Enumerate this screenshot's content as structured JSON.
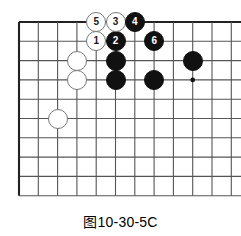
{
  "figure": {
    "caption": "图10-30-5C",
    "board": {
      "origin_x": 19,
      "origin_y": 22,
      "spacing": 19.3,
      "cols": 11,
      "rows": 10,
      "line_color": "#555555",
      "edge_color": "#222222",
      "background": "#ffffff",
      "stone_radius": 10
    },
    "star_points": [
      {
        "name": "hoshi-right",
        "col": 9,
        "row": 3
      }
    ],
    "stones": [
      {
        "name": "white-stone-1",
        "color": "white",
        "label": "1",
        "col": 4,
        "row": 1
      },
      {
        "name": "black-stone-2",
        "color": "black",
        "label": "2",
        "col": 5,
        "row": 1
      },
      {
        "name": "white-stone-3",
        "color": "white",
        "label": "3",
        "col": 5,
        "row": 0
      },
      {
        "name": "black-stone-4",
        "color": "black",
        "label": "4",
        "col": 6,
        "row": 0
      },
      {
        "name": "white-stone-5",
        "color": "white",
        "label": "5",
        "col": 4,
        "row": 0
      },
      {
        "name": "black-stone-6",
        "color": "black",
        "label": "6",
        "col": 7,
        "row": 1
      },
      {
        "name": "white-stone-a",
        "color": "white",
        "label": "",
        "col": 3,
        "row": 2
      },
      {
        "name": "white-stone-b",
        "color": "white",
        "label": "",
        "col": 3,
        "row": 3
      },
      {
        "name": "white-stone-c",
        "color": "white",
        "label": "",
        "col": 2,
        "row": 5
      },
      {
        "name": "black-stone-a",
        "color": "black",
        "label": "",
        "col": 5,
        "row": 2
      },
      {
        "name": "black-stone-b",
        "color": "black",
        "label": "",
        "col": 5,
        "row": 3
      },
      {
        "name": "black-stone-c",
        "color": "black",
        "label": "",
        "col": 7,
        "row": 3
      },
      {
        "name": "black-stone-d",
        "color": "black",
        "label": "",
        "col": 9,
        "row": 2
      }
    ]
  }
}
